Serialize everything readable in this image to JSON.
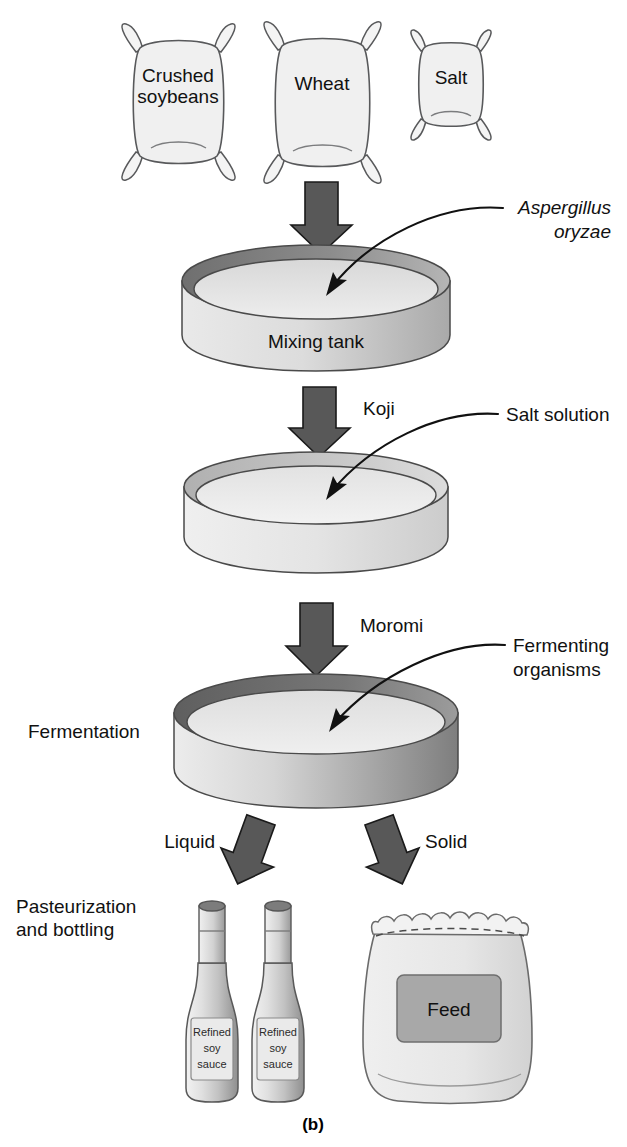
{
  "figure": {
    "caption": "(b)"
  },
  "ingredients": [
    {
      "id": "soybeans",
      "label_line1": "Crushed",
      "label_line2": "soybeans"
    },
    {
      "id": "wheat",
      "label_line1": "Wheat",
      "label_line2": ""
    },
    {
      "id": "salt",
      "label_line1": "Salt",
      "label_line2": ""
    }
  ],
  "vessels": [
    {
      "id": "mixing-tank",
      "label": "Mixing tank"
    },
    {
      "id": "koji-tank",
      "label": ""
    },
    {
      "id": "fermentation-tank",
      "label": ""
    }
  ],
  "stage_labels": {
    "fermentation": "Fermentation",
    "pasteurization_line1": "Pasteurization",
    "pasteurization_line2": "and bottling"
  },
  "flow_labels": {
    "koji": "Koji",
    "moromi": "Moromi",
    "liquid": "Liquid",
    "solid": "Solid"
  },
  "annotations": [
    {
      "id": "aspergillus",
      "line1": "Aspergillus",
      "line2": "oryzae",
      "italic": true
    },
    {
      "id": "salt-solution",
      "line1": "Salt solution",
      "line2": "",
      "italic": false
    },
    {
      "id": "fermenting-organisms",
      "line1": "Fermenting",
      "line2": "organisms",
      "italic": false
    }
  ],
  "products": {
    "bottle_label_line1": "Refined",
    "bottle_label_line2": "soy",
    "bottle_label_line3": "sauce",
    "feed_label": "Feed"
  },
  "colors": {
    "background": "#ffffff",
    "arrow_fill": "#585858",
    "arrow_stroke": "#1a1a1a",
    "sack_fill": "#f0f0f0",
    "sack_stroke": "#58595b",
    "tank_light": "#e3e3e3",
    "tank_mid": "#c9c9c9",
    "tank_dark": "#7f7f7f",
    "text": "#111111",
    "feed_patch": "#a8a8a8"
  }
}
